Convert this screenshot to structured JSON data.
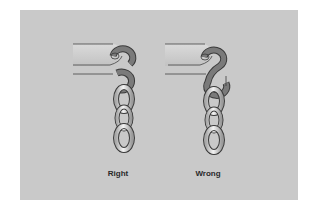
{
  "figure": {
    "panel_color": "#c9c9c9",
    "hook_color": "#7a7a7a",
    "link_color": "#e8e8e8",
    "outline_color": "#3a3a3a",
    "examples": [
      {
        "id": "right",
        "label": "Right"
      },
      {
        "id": "wrong",
        "label": "Wrong"
      }
    ]
  }
}
